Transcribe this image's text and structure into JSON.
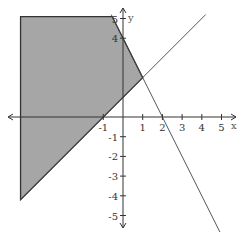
{
  "chart_data": {
    "type": "area",
    "title": "",
    "xlabel": "x",
    "ylabel": "y",
    "xlim": [
      -5.5,
      5.5
    ],
    "ylim": [
      -5.5,
      5.5
    ],
    "grid": false,
    "x_ticks": [
      -1,
      1,
      2,
      3,
      4,
      5
    ],
    "y_ticks": [
      5,
      4,
      -1,
      -2,
      -3,
      -4,
      -5
    ],
    "series": [
      {
        "name": "line-y=x+1",
        "style": "thin",
        "points": [
          [
            -5.2,
            -4.2
          ],
          [
            4.2,
            5.2
          ]
        ]
      },
      {
        "name": "line-y=-2x+4",
        "style": "thin",
        "points": [
          [
            -0.6,
            5.2
          ],
          [
            5.2,
            -6.4
          ]
        ]
      },
      {
        "name": "shaded-region",
        "fill": "#a6a6a6",
        "vertices": [
          [
            -5.2,
            5.1
          ],
          [
            -0.55,
            5.1
          ],
          [
            1,
            2
          ],
          [
            -5.2,
            -4.2
          ]
        ]
      }
    ],
    "intersection": [
      1,
      2
    ]
  },
  "labels": {
    "x_axis": "x",
    "y_axis": "y"
  },
  "colors": {
    "fill": "#a6a6a6",
    "line": "#333333",
    "axis": "#333333"
  }
}
